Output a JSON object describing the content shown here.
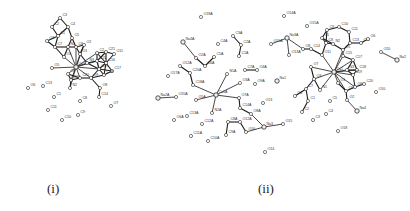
{
  "figure": {
    "background": "#ffffff",
    "ink_color": "#1a1a1a"
  },
  "panels": [
    {
      "id": "i",
      "label": "(i)",
      "label_pos": [
        47,
        181
      ],
      "metal_center": "Ca1",
      "atoms": [
        {
          "name": "C3",
          "x": 60,
          "y": 18,
          "type": "C"
        },
        {
          "name": "C2",
          "x": 52,
          "y": 27,
          "type": "C"
        },
        {
          "name": "C4",
          "x": 68,
          "y": 27,
          "type": "C"
        },
        {
          "name": "C1",
          "x": 58,
          "y": 36,
          "type": "C"
        },
        {
          "name": "C5",
          "x": 72,
          "y": 38,
          "type": "C"
        },
        {
          "name": "O3",
          "x": 47,
          "y": 41,
          "type": "O"
        },
        {
          "name": "C7",
          "x": 55,
          "y": 47,
          "type": "C"
        },
        {
          "name": "N1",
          "x": 68,
          "y": 47,
          "type": "N"
        },
        {
          "name": "C6",
          "x": 76,
          "y": 47,
          "type": "C"
        },
        {
          "name": "O2",
          "x": 84,
          "y": 45,
          "type": "O"
        },
        {
          "name": "O1",
          "x": 80,
          "y": 54,
          "type": "O"
        },
        {
          "name": "O4",
          "x": 64,
          "y": 57,
          "type": "O"
        },
        {
          "name": "C22",
          "x": 97,
          "y": 53,
          "type": "C"
        },
        {
          "name": "C21",
          "x": 106,
          "y": 52,
          "type": "C"
        },
        {
          "name": "O11",
          "x": 114,
          "y": 54,
          "type": "O"
        },
        {
          "name": "O5",
          "x": 52,
          "y": 68,
          "type": "O"
        },
        {
          "name": "Ca1",
          "x": 76,
          "y": 67,
          "type": "Ca"
        },
        {
          "name": "N3",
          "x": 87,
          "y": 63,
          "type": "N"
        },
        {
          "name": "C15",
          "x": 97,
          "y": 61,
          "type": "C"
        },
        {
          "name": "C16",
          "x": 106,
          "y": 63,
          "type": "C"
        },
        {
          "name": "C17",
          "x": 112,
          "y": 71,
          "type": "C"
        },
        {
          "name": "C19",
          "x": 99,
          "y": 69,
          "type": "C"
        },
        {
          "name": "C18",
          "x": 104,
          "y": 75,
          "type": "C"
        },
        {
          "name": "O8",
          "x": 68,
          "y": 74,
          "type": "O"
        },
        {
          "name": "O10",
          "x": 71,
          "y": 80,
          "type": "O"
        },
        {
          "name": "C20",
          "x": 80,
          "y": 78,
          "type": "C"
        },
        {
          "name": "O9",
          "x": 91,
          "y": 78,
          "type": "O"
        },
        {
          "name": "O6",
          "x": 28,
          "y": 88,
          "type": "O"
        },
        {
          "name": "C13",
          "x": 43,
          "y": 86,
          "type": "C"
        },
        {
          "name": "N2",
          "x": 70,
          "y": 88,
          "type": "N"
        },
        {
          "name": "O8b",
          "x": 100,
          "y": 88,
          "type": "O"
        },
        {
          "name": "C12",
          "x": 54,
          "y": 97,
          "type": "C"
        },
        {
          "name": "C8",
          "x": 80,
          "y": 101,
          "type": "C"
        },
        {
          "name": "C14",
          "x": 99,
          "y": 97,
          "type": "C"
        },
        {
          "name": "O7",
          "x": 111,
          "y": 106,
          "type": "O"
        },
        {
          "name": "C11",
          "x": 48,
          "y": 110,
          "type": "C"
        },
        {
          "name": "C9",
          "x": 78,
          "y": 115,
          "type": "C"
        },
        {
          "name": "C10",
          "x": 62,
          "y": 120,
          "type": "C"
        }
      ],
      "visible_labels": [
        "C3",
        "C2",
        "C4",
        "C1",
        "C5",
        "O3",
        "C7",
        "N1",
        "C6",
        "O2",
        "O1",
        "O4",
        "C22",
        "C21",
        "O11",
        "O5",
        "Ca1",
        "N3",
        "C15",
        "C16",
        "C17",
        "C19",
        "C18",
        "O8",
        "O10",
        "C20",
        "O9",
        "O6",
        "C13",
        "N2",
        "C12",
        "C8",
        "C14",
        "O7",
        "C11",
        "C9",
        "C10"
      ]
    },
    {
      "id": "ii",
      "label": "(ii)",
      "label_pos": [
        258,
        181
      ],
      "metal_centers": [
        "Ca1A",
        "Ca1",
        "Na1",
        "Na3",
        "Na3A",
        "Na4",
        "Na4A",
        "Na2",
        "Na2A"
      ],
      "atoms": [
        {
          "name": "O18A",
          "x": 201,
          "y": 17,
          "type": "O"
        },
        {
          "name": "Na4A",
          "x": 183,
          "y": 42,
          "type": "Na"
        },
        {
          "name": "C3A",
          "x": 233,
          "y": 36,
          "type": "C"
        },
        {
          "name": "C4A",
          "x": 218,
          "y": 44,
          "type": "C"
        },
        {
          "name": "C2A",
          "x": 241,
          "y": 45,
          "type": "C"
        },
        {
          "name": "O2A",
          "x": 196,
          "y": 58,
          "type": "O"
        },
        {
          "name": "C5A",
          "x": 214,
          "y": 57,
          "type": "C"
        },
        {
          "name": "C1A",
          "x": 239,
          "y": 56,
          "type": "C"
        },
        {
          "name": "O12A",
          "x": 180,
          "y": 66,
          "type": "O"
        },
        {
          "name": "C6A",
          "x": 205,
          "y": 66,
          "type": "C"
        },
        {
          "name": "O17A",
          "x": 168,
          "y": 76,
          "type": "O"
        },
        {
          "name": "C20A",
          "x": 190,
          "y": 73,
          "type": "C"
        },
        {
          "name": "N1A",
          "x": 227,
          "y": 74,
          "type": "N"
        },
        {
          "name": "C7A",
          "x": 245,
          "y": 70,
          "type": "C"
        },
        {
          "name": "O4A",
          "x": 257,
          "y": 70,
          "type": "O"
        },
        {
          "name": "C18A",
          "x": 193,
          "y": 85,
          "type": "C"
        },
        {
          "name": "Ca1A",
          "x": 216,
          "y": 95,
          "type": "Ca"
        },
        {
          "name": "O3A",
          "x": 240,
          "y": 83,
          "type": "O"
        },
        {
          "name": "O9A",
          "x": 255,
          "y": 84,
          "type": "O"
        },
        {
          "name": "Na1",
          "x": 277,
          "y": 81,
          "type": "Na"
        },
        {
          "name": "Na2A",
          "x": 158,
          "y": 98,
          "type": "Na"
        },
        {
          "name": "O20A",
          "x": 176,
          "y": 97,
          "type": "O"
        },
        {
          "name": "O5A",
          "x": 196,
          "y": 100,
          "type": "O"
        },
        {
          "name": "O7A",
          "x": 239,
          "y": 98,
          "type": "O"
        },
        {
          "name": "O13",
          "x": 263,
          "y": 103,
          "type": "O"
        },
        {
          "name": "O6A",
          "x": 174,
          "y": 120,
          "type": "O"
        },
        {
          "name": "C13A",
          "x": 187,
          "y": 116,
          "type": "C"
        },
        {
          "name": "N2A",
          "x": 212,
          "y": 113,
          "type": "N"
        },
        {
          "name": "C14A",
          "x": 240,
          "y": 108,
          "type": "C"
        },
        {
          "name": "O8A",
          "x": 251,
          "y": 114,
          "type": "O"
        },
        {
          "name": "C12A",
          "x": 202,
          "y": 124,
          "type": "C"
        },
        {
          "name": "C8A",
          "x": 228,
          "y": 122,
          "type": "C"
        },
        {
          "name": "O12A2",
          "x": 240,
          "y": 122,
          "type": "O"
        },
        {
          "name": "Na3",
          "x": 264,
          "y": 127,
          "type": "Na"
        },
        {
          "name": "O16",
          "x": 246,
          "y": 132,
          "type": "O"
        },
        {
          "name": "O15",
          "x": 283,
          "y": 124,
          "type": "O"
        },
        {
          "name": "C11A",
          "x": 191,
          "y": 136,
          "type": "C"
        },
        {
          "name": "C9A",
          "x": 226,
          "y": 135,
          "type": "C"
        },
        {
          "name": "C10A",
          "x": 208,
          "y": 141,
          "type": "C"
        },
        {
          "name": "O14",
          "x": 265,
          "y": 152,
          "type": "O"
        },
        {
          "name": "O14A",
          "x": 284,
          "y": 16,
          "type": "O"
        },
        {
          "name": "O15A",
          "x": 307,
          "y": 26,
          "type": "O"
        },
        {
          "name": "Na3A",
          "x": 287,
          "y": 38,
          "type": "Na"
        },
        {
          "name": "O15A2",
          "x": 271,
          "y": 44,
          "type": "O"
        },
        {
          "name": "O13A",
          "x": 289,
          "y": 55,
          "type": "O"
        },
        {
          "name": "O8",
          "x": 303,
          "y": 49,
          "type": "O"
        },
        {
          "name": "C14",
          "x": 311,
          "y": 49,
          "type": "C"
        },
        {
          "name": "C9",
          "x": 327,
          "y": 30,
          "type": "C"
        },
        {
          "name": "C10",
          "x": 339,
          "y": 27,
          "type": "C"
        },
        {
          "name": "C11",
          "x": 349,
          "y": 32,
          "type": "C"
        },
        {
          "name": "C8",
          "x": 326,
          "y": 43,
          "type": "C"
        },
        {
          "name": "C12",
          "x": 322,
          "y": 38,
          "type": "C"
        },
        {
          "name": "N2",
          "x": 333,
          "y": 44,
          "type": "N"
        },
        {
          "name": "C13",
          "x": 350,
          "y": 43,
          "type": "C"
        },
        {
          "name": "O5",
          "x": 343,
          "y": 50,
          "type": "O"
        },
        {
          "name": "C12b",
          "x": 361,
          "y": 43,
          "type": "C"
        },
        {
          "name": "O6",
          "x": 368,
          "y": 39,
          "type": "O"
        },
        {
          "name": "O20",
          "x": 381,
          "y": 52,
          "type": "O"
        },
        {
          "name": "Na2",
          "x": 397,
          "y": 60,
          "type": "Na"
        },
        {
          "name": "O7",
          "x": 311,
          "y": 67,
          "type": "O"
        },
        {
          "name": "C15",
          "x": 343,
          "y": 56,
          "type": "C"
        },
        {
          "name": "C17",
          "x": 353,
          "y": 60,
          "type": "C"
        },
        {
          "name": "O11",
          "x": 322,
          "y": 55,
          "type": "O"
        },
        {
          "name": "Ca1",
          "x": 334,
          "y": 72,
          "type": "Ca"
        },
        {
          "name": "N3",
          "x": 347,
          "y": 70,
          "type": "N"
        },
        {
          "name": "C18",
          "x": 357,
          "y": 70,
          "type": "C"
        },
        {
          "name": "C19",
          "x": 353,
          "y": 75,
          "type": "C"
        },
        {
          "name": "O3",
          "x": 314,
          "y": 79,
          "type": "O"
        },
        {
          "name": "O1",
          "x": 338,
          "y": 83,
          "type": "O"
        },
        {
          "name": "C20",
          "x": 364,
          "y": 84,
          "type": "C"
        },
        {
          "name": "O10",
          "x": 376,
          "y": 92,
          "type": "O"
        },
        {
          "name": "O9",
          "x": 355,
          "y": 87,
          "type": "O"
        },
        {
          "name": "C7",
          "x": 306,
          "y": 89,
          "type": "C"
        },
        {
          "name": "N1",
          "x": 320,
          "y": 90,
          "type": "N"
        },
        {
          "name": "C6",
          "x": 346,
          "y": 91,
          "type": "C"
        },
        {
          "name": "O4",
          "x": 295,
          "y": 96,
          "type": "O"
        },
        {
          "name": "C1",
          "x": 308,
          "y": 101,
          "type": "C"
        },
        {
          "name": "C5",
          "x": 330,
          "y": 101,
          "type": "C"
        },
        {
          "name": "O2",
          "x": 347,
          "y": 100,
          "type": "O"
        },
        {
          "name": "Na4",
          "x": 357,
          "y": 111,
          "type": "Na"
        },
        {
          "name": "C2",
          "x": 302,
          "y": 112,
          "type": "C"
        },
        {
          "name": "C4",
          "x": 326,
          "y": 114,
          "type": "C"
        },
        {
          "name": "C3",
          "x": 313,
          "y": 120,
          "type": "C"
        },
        {
          "name": "O18",
          "x": 338,
          "y": 131,
          "type": "O"
        }
      ],
      "visible_labels": [
        "O18A",
        "Na4A",
        "C3A",
        "C4A",
        "C2A",
        "O2A",
        "C5A",
        "C1A",
        "O12A",
        "C6A",
        "O17A",
        "C20A",
        "N1A",
        "C7A",
        "O4A",
        "C18A",
        "Ca1A",
        "O3A",
        "O9A",
        "Na1",
        "Na2A",
        "O20A",
        "O5A",
        "O7A",
        "O13",
        "O6A",
        "C13A",
        "N2A",
        "C14A",
        "O8A",
        "C12A",
        "C8A",
        "O12A",
        "Na3",
        "O16",
        "O15",
        "C11A",
        "C9A",
        "C10A",
        "O14",
        "O14A",
        "O15A",
        "Na3A",
        "O13A",
        "O8",
        "C14",
        "C9",
        "C10",
        "C11",
        "C8",
        "C12",
        "N2",
        "C13",
        "O5",
        "O6",
        "O20",
        "Na2",
        "O7",
        "C15",
        "C17",
        "O11",
        "Ca1",
        "N3",
        "C18",
        "C19",
        "O3",
        "O1",
        "C20",
        "O10",
        "O9",
        "C7",
        "N1",
        "C6",
        "O4",
        "C1",
        "C5",
        "O2",
        "Na4",
        "C2",
        "C4",
        "C3",
        "O18"
      ]
    }
  ]
}
